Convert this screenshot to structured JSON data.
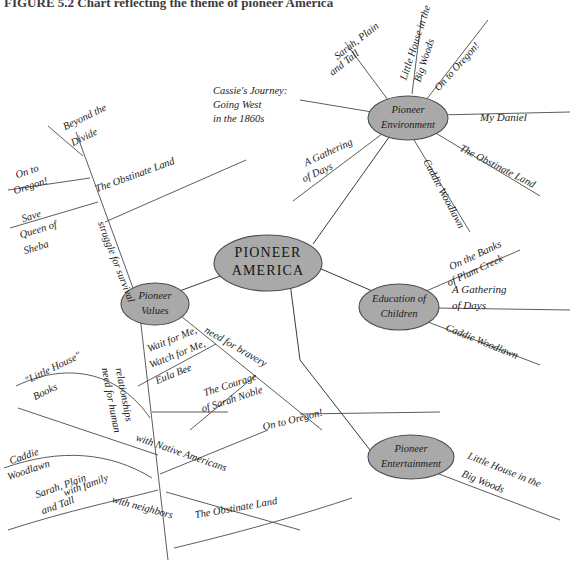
{
  "header": {
    "caption": "FIGURE 5.2  Chart reflecting the theme of pioneer America"
  },
  "diagram": {
    "type": "mind-map",
    "center": {
      "label": "PIONEER AMERICA",
      "line1": "PIONEER",
      "line2": "AMERICA"
    },
    "node_fill": "#a9a9a9",
    "node_stroke": "#4d4d4d",
    "line_color": "#3a3a3a",
    "background": "#ffffff",
    "branches": [
      {
        "id": "pioneer-values",
        "line1": "Pioneer",
        "line2": "Values",
        "label": "Pioneer Values",
        "subtopics": [
          {
            "label": "struggle for survival",
            "leaves": [
              "Beyond the Divide",
              "On to Oregon!",
              "Save Queen of Sheba",
              "The Obstinate Land"
            ]
          },
          {
            "label": "need for bravery",
            "leaves": [
              "Wait for Me, Watch for Me, Eula Bee",
              "The Courage of Sarah Noble",
              "On to Oregon!"
            ]
          },
          {
            "label": "need for human relationships",
            "leaves": [
              "\"Little House\" Books",
              "Caddie Woodlawn",
              "Sarah, Plain and Tall",
              "The Obstinate Land"
            ],
            "sublabels": [
              "with family",
              "with Native Americans",
              "with neighbors"
            ]
          }
        ]
      },
      {
        "id": "pioneer-environment",
        "line1": "Pioneer",
        "line2": "Environment",
        "label": "Pioneer Environment",
        "leaves": [
          "Cassie's Journey: Going West in the 1860s",
          "Sarah, Plain and Tall",
          "Little House in the Big Woods",
          "On to Oregon!",
          "My Daniel",
          "The Obstinate Land",
          "Caddie Woodlawn",
          "A Gathering of Days"
        ]
      },
      {
        "id": "education-of-children",
        "line1": "Education of",
        "line2": "Children",
        "label": "Education of Children",
        "leaves": [
          "On the Banks of Plum Creek",
          "A Gathering of Days",
          "Caddie Woodlawn"
        ]
      },
      {
        "id": "pioneer-entertainment",
        "line1": "Pioneer",
        "line2": "Entertainment",
        "label": "Pioneer Entertainment",
        "leaves": [
          "Little House in the Big Woods"
        ]
      }
    ],
    "leaf_labels": {
      "env_cassie_l1": "Cassie's Journey:",
      "env_cassie_l2": "Going West",
      "env_cassie_l3": "in the 1860s",
      "env_sarah_l1": "Sarah, Plain",
      "env_sarah_l2": "and Tall",
      "env_little_l1": "Little House in the",
      "env_little_l2": "Big Woods",
      "env_oregon": "On to Oregon!",
      "env_daniel": "My Daniel",
      "env_obstinate": "The Obstinate Land",
      "env_caddie": "Caddie Woodlawn",
      "env_gathering_l1": "A Gathering",
      "env_gathering_l2": "of Days",
      "val_beyond_l1": "Beyond the",
      "val_beyond_l2": "Divide",
      "val_oregon_l1": "On to",
      "val_oregon_l2": "Oregon!",
      "val_sheba_l1": "Save",
      "val_sheba_l2": "Queen of",
      "val_sheba_l3": "Sheba",
      "val_obstinate": "The Obstinate Land",
      "val_struggle": "struggle for survival",
      "val_bravery": "need for bravery",
      "val_eula_l1": "Wait for Me,",
      "val_eula_l2": "Watch for Me,",
      "val_eula_l3": "Eula Bee",
      "val_noble_l1": "The Courage",
      "val_noble_l2": "of Sarah Noble",
      "val_noble_oregon": "On to Oregon!",
      "val_relationships_l1": "need for human",
      "val_relationships_l2": "relationships",
      "val_littlehouse_l1": "\"Little House\"",
      "val_littlehouse_l2": "Books",
      "val_caddie_l1": "Caddie",
      "val_caddie_l2": "Woodlawn",
      "val_sarah_l1": "Sarah, Plain",
      "val_sarah_l2": "and Tall",
      "val_family": "with family",
      "val_natives": "with Native Americans",
      "val_neighbors": "with neighbors",
      "val_obstinate2": "The Obstinate Land",
      "edu_plum_l1": "On the Banks",
      "edu_plum_l2": "of Plum Creek",
      "edu_gathering_l1": "A Gathering",
      "edu_gathering_l2": "of Days",
      "edu_caddie": "Caddie Woodlawn",
      "ent_little_l1": "Little House in the",
      "ent_little_l2": "Big Woods"
    }
  }
}
